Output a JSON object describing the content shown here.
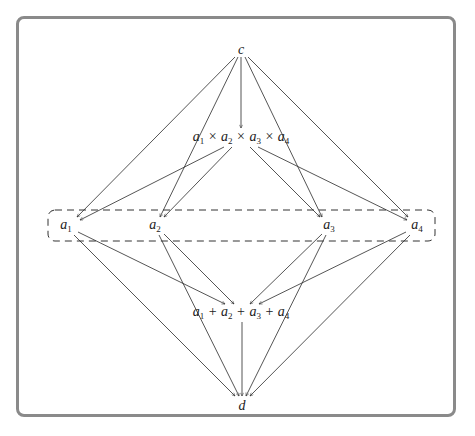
{
  "frame": {
    "border_color": "#8a8a8a"
  },
  "nodes": [
    {
      "id": "c",
      "label": "c",
      "x": 241,
      "y": 50
    },
    {
      "id": "prod",
      "label": "a1 × a2 × a3 × a4",
      "x": 241,
      "y": 138,
      "parts": [
        [
          "a",
          "1"
        ],
        [
          "×"
        ],
        [
          "a",
          "2"
        ],
        [
          "×"
        ],
        [
          "a",
          "3"
        ],
        [
          "×"
        ],
        [
          "a",
          "4"
        ]
      ]
    },
    {
      "id": "a1",
      "label": "a1",
      "x": 66,
      "y": 226,
      "parts": [
        [
          "a",
          "1"
        ]
      ]
    },
    {
      "id": "a2",
      "label": "a2",
      "x": 155,
      "y": 226,
      "parts": [
        [
          "a",
          "2"
        ]
      ]
    },
    {
      "id": "a3",
      "label": "a3",
      "x": 329,
      "y": 226,
      "parts": [
        [
          "a",
          "3"
        ]
      ]
    },
    {
      "id": "a4",
      "label": "a4",
      "x": 417,
      "y": 226,
      "parts": [
        [
          "a",
          "4"
        ]
      ]
    },
    {
      "id": "sum",
      "label": "a1 + a2 + a3 + a4",
      "x": 241,
      "y": 313,
      "parts": [
        [
          "a",
          "1"
        ],
        [
          "+"
        ],
        [
          "a",
          "2"
        ],
        [
          "+"
        ],
        [
          "a",
          "3"
        ],
        [
          "+"
        ],
        [
          "a",
          "4"
        ]
      ]
    },
    {
      "id": "d",
      "label": "d",
      "x": 242,
      "y": 406
    }
  ],
  "group": {
    "label": "a-nodes group",
    "x": 48,
    "y": 210,
    "width": 387,
    "height": 31,
    "radius": 7,
    "style": "dashed"
  },
  "edges": [
    {
      "from": "c",
      "to": "a1",
      "x1": 235,
      "y1": 57,
      "x2": 77,
      "y2": 217
    },
    {
      "from": "c",
      "to": "a2",
      "x1": 238,
      "y1": 57,
      "x2": 160,
      "y2": 217
    },
    {
      "from": "c",
      "to": "prod",
      "x1": 241,
      "y1": 57,
      "x2": 241,
      "y2": 128
    },
    {
      "from": "c",
      "to": "a3",
      "x1": 245,
      "y1": 57,
      "x2": 322,
      "y2": 217
    },
    {
      "from": "c",
      "to": "a4",
      "x1": 248,
      "y1": 57,
      "x2": 408,
      "y2": 217
    },
    {
      "from": "prod",
      "to": "a1",
      "x1": 224,
      "y1": 147,
      "x2": 80,
      "y2": 220
    },
    {
      "from": "prod",
      "to": "a2",
      "x1": 232,
      "y1": 147,
      "x2": 164,
      "y2": 217
    },
    {
      "from": "prod",
      "to": "a3",
      "x1": 250,
      "y1": 147,
      "x2": 320,
      "y2": 217
    },
    {
      "from": "prod",
      "to": "a4",
      "x1": 258,
      "y1": 147,
      "x2": 407,
      "y2": 220
    },
    {
      "from": "a1",
      "to": "sum",
      "x1": 78,
      "y1": 232,
      "x2": 225,
      "y2": 304
    },
    {
      "from": "a2",
      "to": "sum",
      "x1": 164,
      "y1": 234,
      "x2": 234,
      "y2": 304
    },
    {
      "from": "a3",
      "to": "sum",
      "x1": 322,
      "y1": 234,
      "x2": 250,
      "y2": 304
    },
    {
      "from": "a4",
      "to": "sum",
      "x1": 406,
      "y1": 232,
      "x2": 259,
      "y2": 304
    },
    {
      "from": "a1",
      "to": "d",
      "x1": 74,
      "y1": 235,
      "x2": 235,
      "y2": 396
    },
    {
      "from": "a2",
      "to": "d",
      "x1": 159,
      "y1": 235,
      "x2": 239,
      "y2": 396
    },
    {
      "from": "sum",
      "to": "d",
      "x1": 242,
      "y1": 322,
      "x2": 242,
      "y2": 396
    },
    {
      "from": "a3",
      "to": "d",
      "x1": 326,
      "y1": 235,
      "x2": 246,
      "y2": 396
    },
    {
      "from": "a4",
      "to": "d",
      "x1": 410,
      "y1": 235,
      "x2": 250,
      "y2": 396
    }
  ]
}
